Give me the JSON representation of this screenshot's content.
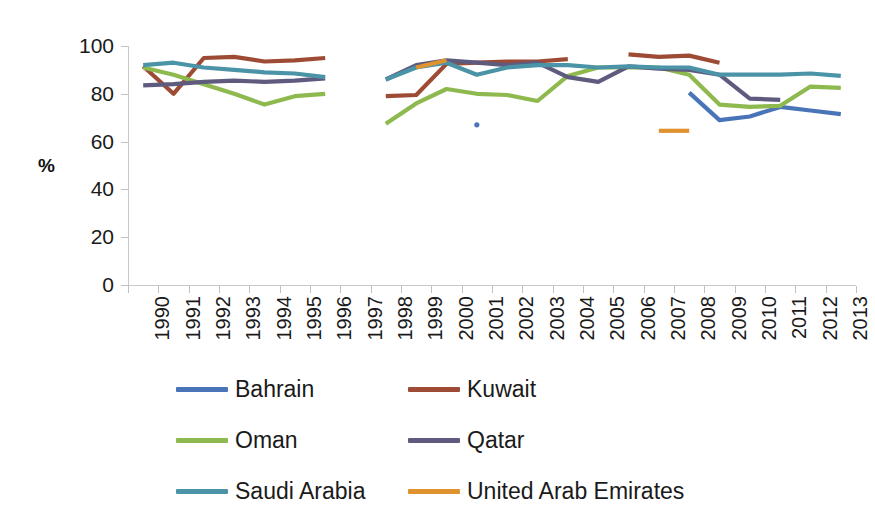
{
  "chart_data": {
    "type": "line",
    "title": "",
    "xlabel": "",
    "ylabel": "%",
    "ylim": [
      0,
      100
    ],
    "ytick_values": [
      0,
      20,
      40,
      60,
      80,
      100
    ],
    "grid": false,
    "legend_position": "bottom",
    "categories": [
      "1990",
      "1991",
      "1992",
      "1993",
      "1994",
      "1995",
      "1996",
      "1997",
      "1998",
      "1999",
      "2000",
      "2001",
      "2002",
      "2003",
      "2004",
      "2005",
      "2006",
      "2007",
      "2008",
      "2009",
      "2010",
      "2011",
      "2012",
      "2013"
    ],
    "series": [
      {
        "name": "Bahrain",
        "color": "#4A74B8",
        "values": [
          null,
          null,
          null,
          null,
          null,
          null,
          null,
          null,
          null,
          null,
          null,
          67,
          null,
          null,
          null,
          null,
          null,
          null,
          80.5,
          69,
          70.5,
          74.5,
          73,
          71.5
        ]
      },
      {
        "name": "Kuwait",
        "color": "#9E4B35",
        "values": [
          91.5,
          80,
          95,
          95.5,
          93.5,
          94,
          95,
          null,
          79,
          79.5,
          92.5,
          93,
          93.5,
          93.5,
          94.5,
          null,
          96.5,
          95.5,
          96,
          93,
          null,
          null,
          null,
          null
        ]
      },
      {
        "name": "Oman",
        "color": "#8EB94E",
        "values": [
          91,
          88,
          84,
          80,
          75.5,
          79,
          80,
          null,
          67.5,
          76,
          82,
          80,
          79.5,
          77,
          87.5,
          91,
          91,
          91,
          88,
          75.5,
          74.5,
          75,
          83,
          82.5
        ]
      },
      {
        "name": "Qatar",
        "color": "#5F5B7E",
        "values": [
          83.5,
          84,
          85,
          85.5,
          85,
          85.5,
          86.5,
          null,
          86,
          92,
          94,
          93,
          92,
          93,
          87,
          85,
          91.5,
          90.5,
          90,
          88,
          78,
          77.5,
          null,
          null
        ]
      },
      {
        "name": "Saudi Arabia",
        "color": "#4B94A8",
        "values": [
          92,
          93,
          91,
          90,
          89,
          88.5,
          87,
          null,
          86,
          91,
          93,
          88,
          91,
          92,
          92,
          91,
          91.5,
          91,
          91,
          88,
          88,
          88,
          88.5,
          87.5
        ]
      },
      {
        "name": "United Arab Emirates",
        "color": "#E0922F",
        "values": [
          null,
          null,
          null,
          null,
          null,
          null,
          null,
          null,
          null,
          91,
          94,
          null,
          null,
          null,
          null,
          null,
          null,
          64.5,
          64.5,
          null,
          null,
          null,
          null,
          null
        ]
      }
    ]
  },
  "legend": {
    "entries": [
      {
        "label": "Bahrain"
      },
      {
        "label": "Kuwait"
      },
      {
        "label": "Oman"
      },
      {
        "label": "Qatar"
      },
      {
        "label": "Saudi Arabia"
      },
      {
        "label": "United Arab Emirates"
      }
    ]
  }
}
